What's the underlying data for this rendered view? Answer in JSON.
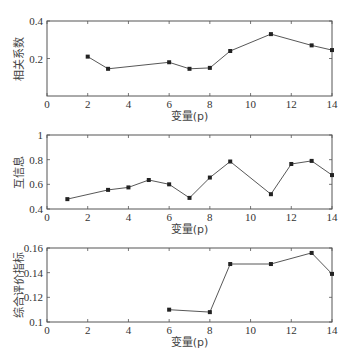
{
  "chart_data": [
    {
      "type": "line",
      "title": "",
      "xlabel": "变量(p)",
      "ylabel": "相关系数",
      "xlim": [
        0,
        14
      ],
      "ylim": [
        0,
        0.4
      ],
      "xticks": [
        0,
        2,
        4,
        6,
        8,
        10,
        12,
        14
      ],
      "yticks": [
        0.2,
        0.4
      ],
      "xtick_labels": [
        "0",
        "2",
        "4",
        "6",
        "8",
        "10",
        "12",
        "14"
      ],
      "ytick_labels": [
        "0.2",
        "0.4"
      ],
      "grid": false,
      "x": [
        2,
        3,
        6,
        7,
        8,
        9,
        11,
        13,
        14
      ],
      "y": [
        0.21,
        0.145,
        0.18,
        0.145,
        0.15,
        0.24,
        0.33,
        0.27,
        0.245
      ],
      "marker": "square"
    },
    {
      "type": "line",
      "title": "",
      "xlabel": "变量(p)",
      "ylabel": "互信息",
      "xlim": [
        0,
        14
      ],
      "ylim": [
        0.4,
        1
      ],
      "xticks": [
        0,
        2,
        4,
        6,
        8,
        10,
        12,
        14
      ],
      "yticks": [
        0.4,
        0.6,
        0.8,
        1
      ],
      "xtick_labels": [
        "0",
        "2",
        "4",
        "6",
        "8",
        "10",
        "12",
        "14"
      ],
      "ytick_labels": [
        "0.4",
        "0.6",
        "0.8",
        "1"
      ],
      "grid": false,
      "x": [
        1,
        3,
        4,
        5,
        6,
        7,
        8,
        9,
        11,
        12,
        13,
        14
      ],
      "y": [
        0.48,
        0.555,
        0.575,
        0.635,
        0.6,
        0.49,
        0.655,
        0.785,
        0.52,
        0.765,
        0.79,
        0.675
      ],
      "marker": "square"
    },
    {
      "type": "line",
      "title": "",
      "xlabel": "变量(p)",
      "ylabel": "综合评价指标",
      "xlim": [
        0,
        14
      ],
      "ylim": [
        0.1,
        0.16
      ],
      "xticks": [
        0,
        2,
        4,
        6,
        8,
        10,
        12,
        14
      ],
      "yticks": [
        0.1,
        0.12,
        0.14,
        0.16
      ],
      "xtick_labels": [
        "0",
        "2",
        "4",
        "6",
        "8",
        "10",
        "12",
        "14"
      ],
      "ytick_labels": [
        "0.1",
        "0.12",
        "0.14",
        "0.16"
      ],
      "grid": false,
      "x": [
        6,
        8,
        9,
        11,
        13,
        14
      ],
      "y": [
        0.11,
        0.108,
        0.147,
        0.147,
        0.156,
        0.139
      ],
      "marker": "square"
    }
  ],
  "layout": {
    "panels": [
      {
        "left": 47,
        "right": 332,
        "top": 21,
        "bottom": 96,
        "first_ytick_label": "0"
      },
      {
        "left": 47,
        "right": 332,
        "top": 135,
        "bottom": 209
      },
      {
        "left": 47,
        "right": 332,
        "top": 248,
        "bottom": 322
      }
    ],
    "colors": {
      "line": "#444444",
      "marker": "#222222",
      "axis": "#555555",
      "text": "#333333"
    }
  }
}
